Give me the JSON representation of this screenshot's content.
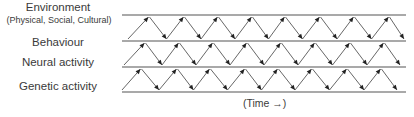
{
  "diagram": {
    "labels": [
      {
        "id": "environment",
        "text": "Environment",
        "sub": "(Physical, Social, Cultural)"
      },
      {
        "id": "behaviour",
        "text": "Behaviour"
      },
      {
        "id": "neural",
        "text": "Neural activity"
      },
      {
        "id": "genetic",
        "text": "Genetic activity"
      }
    ],
    "axis_label": "(Time →)",
    "levels_y": [
      15,
      41,
      67,
      92
    ],
    "line_x": [
      122,
      406
    ],
    "rows": [
      {
        "top": 15,
        "bottom": 41,
        "peaks": [
          149,
          184,
          218,
          252,
          285,
          320,
          354,
          389
        ],
        "start": 128
      },
      {
        "top": 41,
        "bottom": 67,
        "peaks": [
          145,
          179,
          213,
          247,
          281,
          315,
          350,
          384
        ],
        "start": 124
      },
      {
        "top": 67,
        "bottom": 92,
        "peaks": [
          141,
          177,
          210,
          245,
          278,
          312,
          347,
          381
        ],
        "start": 122
      }
    ],
    "colors": {
      "line": "#555555",
      "arrow": "#222222",
      "text": "#3a3a3a"
    }
  }
}
